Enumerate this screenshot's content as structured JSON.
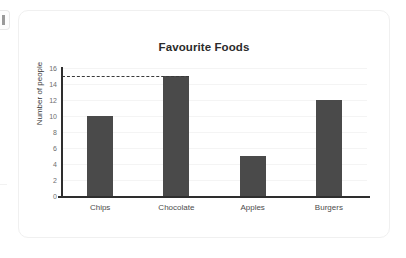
{
  "card": {
    "background_color": "#ffffff",
    "border_color": "#f0f0f0"
  },
  "chart_data": {
    "type": "bar",
    "title": "Favourite Foods",
    "xlabel": "",
    "ylabel": "Number of people",
    "categories": [
      "Chips",
      "Chocolate",
      "Apples",
      "Burgers"
    ],
    "values": [
      10,
      15,
      5,
      12
    ],
    "ylim": [
      0,
      16
    ],
    "ytick_labels": [
      "0",
      "2",
      "4",
      "6",
      "8",
      "10",
      "12",
      "14",
      "16"
    ],
    "ytick_values": [
      0,
      2,
      4,
      6,
      8,
      10,
      12,
      14,
      16
    ],
    "grid": true,
    "legend": "none",
    "bar_color": "#4a4a4a",
    "axis_color": "#2e2e2e",
    "gridline_color": "#f4f4f4",
    "annotations": [
      {
        "name": "reference-line",
        "style": "dashed",
        "value": 15,
        "color": "#3a3a3a",
        "from_category": "axis",
        "to_category": "Chocolate"
      }
    ]
  }
}
